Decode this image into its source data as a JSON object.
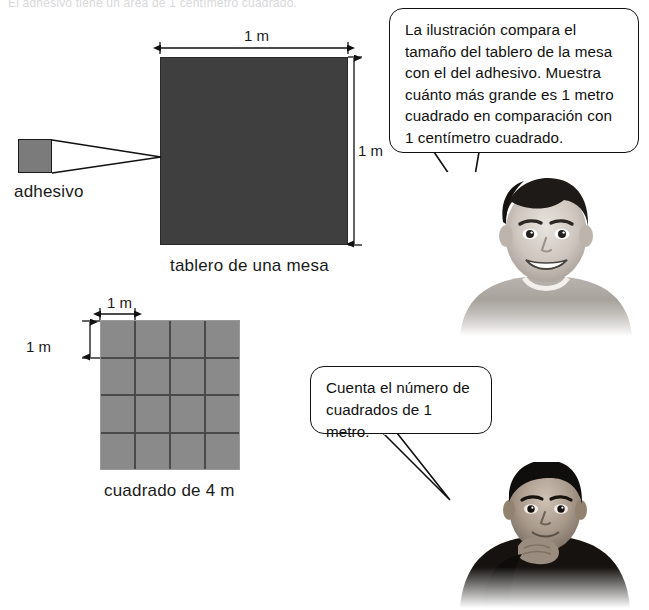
{
  "page": {
    "width": 649,
    "height": 610,
    "background": "#ffffff",
    "header_cut_text": "El adhesivo tiene un área de 1 centímetro cuadrado."
  },
  "colors": {
    "table_gray": "#3f3f3f",
    "sticker_gray": "#7b7b7b",
    "grid_cell_gray": "#8a8a8a",
    "grid_line_gray": "#4a4a4a",
    "ink": "#111111"
  },
  "figures": {
    "sticker": {
      "caption": "adhesivo"
    },
    "tabletop": {
      "caption": "tablero de una mesa",
      "width_label": "1 m",
      "height_label": "1 m"
    },
    "grid": {
      "caption": "cuadrado de 4 m",
      "cell_width_label": "1 m",
      "cell_height_label": "1 m",
      "rows": 4,
      "columns": 4,
      "cell_count": 16
    }
  },
  "bubbles": [
    {
      "id": "bubble-1",
      "speaker": "boy-1",
      "lines": [
        "La ilustración compara el",
        "tamaño del tablero de la mesa",
        "con el del adhesivo. Muestra",
        "cuánto más grande es 1 metro",
        "cuadrado en comparación con",
        "1 centímetro cuadrado."
      ]
    },
    {
      "id": "bubble-2",
      "speaker": "boy-2",
      "lines": [
        "Cuenta el número de",
        "cuadrados de 1 metro."
      ]
    }
  ],
  "photos": [
    {
      "id": "photo-boy-1",
      "alt": "smiling boy in light sweater, grayscale photo"
    },
    {
      "id": "photo-boy-2",
      "alt": "boy resting chin on hand in dark sweater, grayscale photo"
    }
  ]
}
